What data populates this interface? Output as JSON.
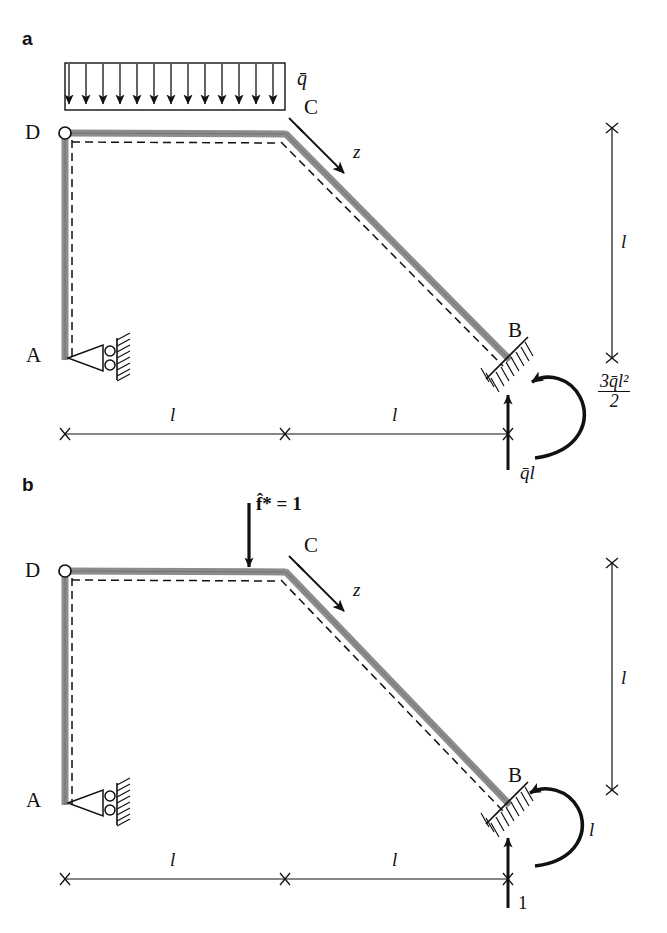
{
  "figure": {
    "type": "structural-engineering-diagram",
    "colors": {
      "member": "#8c8c8c",
      "outline": "#111111",
      "dashed_axis": "#111111",
      "background": "#ffffff"
    }
  },
  "panels": [
    {
      "id": "a",
      "label": "a",
      "nodes": [
        {
          "name": "A",
          "label": "A",
          "x": 65,
          "y": 358,
          "support": "roller"
        },
        {
          "name": "B",
          "label": "B",
          "x": 508,
          "y": 358,
          "support": "fixed-inclined"
        },
        {
          "name": "C",
          "label": "C",
          "x": 285,
          "y": 134,
          "support": "none"
        },
        {
          "name": "D",
          "label": "D",
          "x": 65,
          "y": 133,
          "support": "hinge"
        }
      ],
      "loads": [
        {
          "kind": "distributed",
          "label": "q̄",
          "from_x": 65,
          "to_x": 285,
          "arrow_count": 13,
          "direction": "down"
        },
        {
          "kind": "point-force",
          "label": "q̄l",
          "x": 508,
          "y": 358,
          "direction": "up"
        },
        {
          "kind": "moment",
          "label_numerator": "3q̄l²",
          "label_denominator": "2",
          "label": "3q̄l²/2",
          "direction": "counterclockwise"
        }
      ],
      "axes": [
        {
          "name": "z",
          "label": "z",
          "origin": "C",
          "direction": "along-inclined-member"
        }
      ],
      "dimensions": [
        {
          "label": "l",
          "orientation": "horizontal",
          "from_x": 65,
          "to_x": 285,
          "y": 434
        },
        {
          "label": "l",
          "orientation": "horizontal",
          "from_x": 285,
          "to_x": 508,
          "y": 434
        },
        {
          "label": "l",
          "orientation": "vertical",
          "x": 612,
          "from_y": 128,
          "to_y": 358
        }
      ]
    },
    {
      "id": "b",
      "label": "b",
      "nodes": [
        {
          "name": "A",
          "label": "A",
          "x": 65,
          "y": 803,
          "support": "roller"
        },
        {
          "name": "B",
          "label": "B",
          "x": 508,
          "y": 803,
          "support": "fixed-inclined"
        },
        {
          "name": "C",
          "label": "C",
          "x": 285,
          "y": 572,
          "support": "none"
        },
        {
          "name": "D",
          "label": "D",
          "x": 65,
          "y": 571,
          "support": "hinge"
        }
      ],
      "loads": [
        {
          "kind": "point-force",
          "label": "f̂* = 1",
          "x": 285,
          "y": 572,
          "direction": "down"
        },
        {
          "kind": "point-force",
          "label": "1",
          "x": 508,
          "y": 803,
          "direction": "up"
        },
        {
          "kind": "moment",
          "label": "l",
          "direction": "counterclockwise"
        }
      ],
      "axes": [
        {
          "name": "z",
          "label": "z",
          "origin": "C",
          "direction": "along-inclined-member"
        }
      ],
      "dimensions": [
        {
          "label": "l",
          "orientation": "horizontal",
          "from_x": 65,
          "to_x": 285,
          "y": 879
        },
        {
          "label": "l",
          "orientation": "horizontal",
          "from_x": 285,
          "to_x": 508,
          "y": 879
        },
        {
          "label": "l",
          "orientation": "vertical",
          "x": 612,
          "from_y": 563,
          "to_y": 790
        }
      ]
    }
  ]
}
